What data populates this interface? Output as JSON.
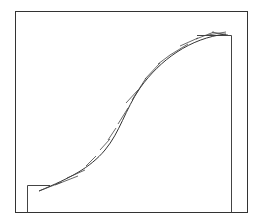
{
  "diagram": {
    "type": "sigmoid curve with tangent segments",
    "stroke_color": "#333333",
    "background": "#ffffff",
    "outer_frame": {
      "x1": 15,
      "y1": 11,
      "x2": 248,
      "y2": 213
    },
    "inner_step_left": {
      "x": 27,
      "top": 185,
      "bottom": 213,
      "right": 50
    },
    "inner_step_right": {
      "x": 231,
      "top": 35,
      "bottom": 213,
      "left": 197
    },
    "curve_path": "M39,191 C70,178 90,168 105,150 C120,132 125,110 140,88 C160,60 190,38 226,34",
    "tangents": [
      [
        39,
        191,
        62,
        182
      ],
      [
        55,
        185,
        78,
        176
      ],
      [
        67,
        178,
        85,
        170
      ],
      [
        86,
        166,
        96,
        156
      ],
      [
        100,
        150,
        110,
        139
      ],
      [
        108,
        140,
        116,
        128
      ],
      [
        118,
        124,
        128,
        108
      ],
      [
        126,
        103,
        138,
        90
      ],
      [
        132,
        100,
        146,
        78
      ],
      [
        145,
        79,
        160,
        63
      ],
      [
        158,
        64,
        170,
        55
      ],
      [
        170,
        55,
        188,
        44
      ],
      [
        180,
        46,
        198,
        38
      ],
      [
        196,
        39,
        214,
        32
      ],
      [
        208,
        35,
        226,
        32
      ],
      [
        212,
        32,
        228,
        35
      ]
    ]
  }
}
